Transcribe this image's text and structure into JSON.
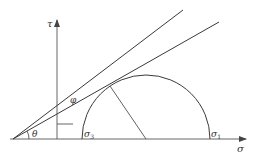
{
  "diagram": {
    "labels": {
      "tau_axis": "τ",
      "sigma_axis": "σ",
      "theta": "θ",
      "phi": "φ",
      "sigma3": "σ",
      "sigma3_sub": "3",
      "sigma1": "σ",
      "sigma1_sub": "1"
    },
    "colors": {
      "stroke": "#3a3a3a",
      "axis": "#555555",
      "background": "#ffffff"
    }
  }
}
